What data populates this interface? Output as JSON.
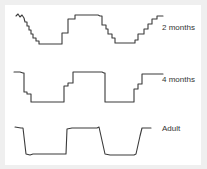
{
  "chart_data": {
    "type": "line",
    "title": "",
    "xlabel": "",
    "ylabel": "",
    "grid": false,
    "legend": "inline labels at right of each trace",
    "series": [
      {
        "name": "2 months",
        "label_pos": [
          162,
          28
        ],
        "points": [
          [
            16,
            16
          ],
          [
            18,
            14
          ],
          [
            20,
            17
          ],
          [
            22,
            15
          ],
          [
            24,
            18
          ],
          [
            25,
            22
          ],
          [
            27,
            22
          ],
          [
            27,
            26
          ],
          [
            29,
            26
          ],
          [
            29,
            30
          ],
          [
            31,
            30
          ],
          [
            31,
            34
          ],
          [
            33,
            34
          ],
          [
            33,
            38
          ],
          [
            36,
            38
          ],
          [
            36,
            41
          ],
          [
            39,
            41
          ],
          [
            39,
            44
          ],
          [
            62,
            44
          ],
          [
            62,
            33
          ],
          [
            68,
            33
          ],
          [
            68,
            19
          ],
          [
            75,
            19
          ],
          [
            75,
            15
          ],
          [
            98,
            15
          ],
          [
            100,
            16
          ],
          [
            102,
            16
          ],
          [
            102,
            25
          ],
          [
            106,
            25
          ],
          [
            106,
            29
          ],
          [
            108,
            29
          ],
          [
            108,
            34
          ],
          [
            112,
            34
          ],
          [
            112,
            38
          ],
          [
            115,
            38
          ],
          [
            115,
            43
          ],
          [
            135,
            43
          ],
          [
            135,
            40
          ],
          [
            138,
            40
          ],
          [
            138,
            34
          ],
          [
            144,
            34
          ],
          [
            144,
            29
          ],
          [
            148,
            29
          ],
          [
            148,
            24
          ],
          [
            152,
            24
          ],
          [
            152,
            19
          ],
          [
            157,
            19
          ],
          [
            157,
            16
          ],
          [
            163,
            16
          ]
        ]
      },
      {
        "name": "4 months",
        "label_pos": [
          162,
          80
        ],
        "points": [
          [
            14,
            72
          ],
          [
            20,
            72
          ],
          [
            23,
            73
          ],
          [
            24,
            73
          ],
          [
            24,
            92
          ],
          [
            27,
            92
          ],
          [
            27,
            94
          ],
          [
            31,
            94
          ],
          [
            31,
            102
          ],
          [
            64,
            102
          ],
          [
            64,
            86
          ],
          [
            68,
            86
          ],
          [
            68,
            83
          ],
          [
            73,
            83
          ],
          [
            73,
            72
          ],
          [
            102,
            72
          ],
          [
            104,
            73
          ],
          [
            105,
            73
          ],
          [
            105,
            102
          ],
          [
            134,
            102
          ],
          [
            134,
            89
          ],
          [
            138,
            89
          ],
          [
            138,
            84
          ],
          [
            142,
            84
          ],
          [
            142,
            74
          ],
          [
            163,
            74
          ]
        ]
      },
      {
        "name": "Adult",
        "label_pos": [
          162,
          129
        ],
        "points": [
          [
            15,
            127
          ],
          [
            21,
            128
          ],
          [
            23,
            128
          ],
          [
            26,
            154
          ],
          [
            30,
            155
          ],
          [
            33,
            154
          ],
          [
            40,
            154
          ],
          [
            58,
            154
          ],
          [
            66,
            154
          ],
          [
            67,
            129
          ],
          [
            72,
            128
          ],
          [
            97,
            128
          ],
          [
            99,
            127
          ],
          [
            105,
            154
          ],
          [
            110,
            155
          ],
          [
            134,
            155
          ],
          [
            136,
            154
          ],
          [
            140,
            136
          ],
          [
            142,
            128
          ],
          [
            151,
            128
          ]
        ]
      }
    ]
  },
  "colors": {
    "background": "#efefef",
    "panel": "#ffffff",
    "trace": "#3a3a3a",
    "label": "#333333"
  }
}
